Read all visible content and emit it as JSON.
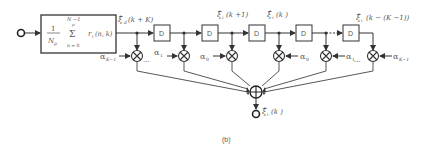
{
  "diagram": {
    "caption": "(b)",
    "input_label": "",
    "averager": {
      "frac_num": "1",
      "frac_den": "N",
      "frac_den_sub": "p",
      "sum_upper": "N  −1",
      "sum_upper2": "p",
      "sum_symbol": "Σ",
      "sum_lower": "n = 0",
      "term": "r",
      "term_sub": "i",
      "term_args": "(n, k)"
    },
    "delay_label": "D",
    "signal_labels": {
      "first": "ξ̂",
      "first_sub": "d",
      "first_args": "(k + K)",
      "second": "ξ̂",
      "second_sub": "i",
      "second_args": "(k +1)",
      "third": "ξ̂",
      "third_sub": "i",
      "third_args": "(k )",
      "last": "ξ̂",
      "last_sub": "i",
      "last_args": "(k − (K  −1))",
      "output": "ξ̃",
      "output_sub": "i",
      "output_args": "(k )"
    },
    "coefficients": [
      "α",
      "α",
      "α",
      "α",
      "α",
      "α"
    ],
    "coefficient_subs": [
      "K−1",
      "1",
      "0",
      "0",
      "1",
      "K−1"
    ],
    "ellipsis": "..."
  }
}
